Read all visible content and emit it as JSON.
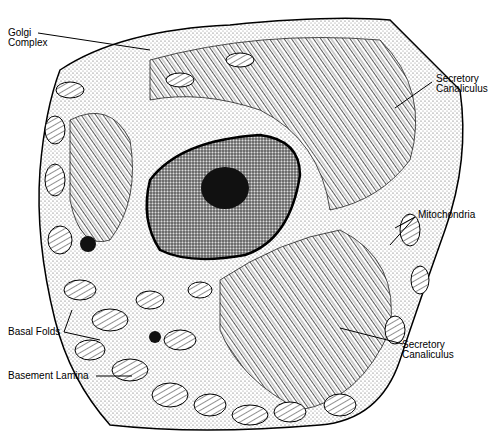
{
  "diagram": {
    "type": "labeled-illustration",
    "labels": [
      {
        "id": "golgi",
        "lines": [
          "Golgi",
          "Complex"
        ]
      },
      {
        "id": "canaliculus-top",
        "lines": [
          "Secretory",
          "Canaliculus"
        ]
      },
      {
        "id": "mitochondria",
        "lines": [
          "Mitochondria"
        ]
      },
      {
        "id": "basal-folds",
        "lines": [
          "Basal Folds"
        ]
      },
      {
        "id": "canaliculus-bottom",
        "lines": [
          "Secretory",
          "Canaliculus"
        ]
      },
      {
        "id": "basement-lamina",
        "lines": [
          "Basement Lamina"
        ]
      }
    ]
  }
}
